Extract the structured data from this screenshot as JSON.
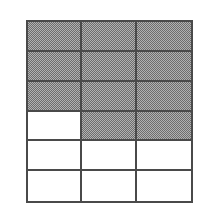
{
  "figure": {
    "type": "area-model-grid",
    "columns": 3,
    "rows": 6,
    "total_cells": 18,
    "shaded_cells": 11,
    "unshaded_cells": 7,
    "fraction_shaded": "11/18",
    "colors": {
      "shaded_fill": "#999999",
      "shaded_dither_dark": "#6e6e6e",
      "shaded_dither_light": "#b2b2b2",
      "unshaded_fill": "#ffffff",
      "grid_line": "#4a4a4a",
      "background": "#ffffff"
    },
    "grid": [
      {
        "row": 1,
        "cells": [
          {
            "col": 1,
            "shaded": true
          },
          {
            "col": 2,
            "shaded": true
          },
          {
            "col": 3,
            "shaded": true
          }
        ]
      },
      {
        "row": 2,
        "cells": [
          {
            "col": 1,
            "shaded": true
          },
          {
            "col": 2,
            "shaded": true
          },
          {
            "col": 3,
            "shaded": true
          }
        ]
      },
      {
        "row": 3,
        "cells": [
          {
            "col": 1,
            "shaded": true
          },
          {
            "col": 2,
            "shaded": true
          },
          {
            "col": 3,
            "shaded": true
          }
        ]
      },
      {
        "row": 4,
        "cells": [
          {
            "col": 1,
            "shaded": false
          },
          {
            "col": 2,
            "shaded": true
          },
          {
            "col": 3,
            "shaded": true
          }
        ]
      },
      {
        "row": 5,
        "cells": [
          {
            "col": 1,
            "shaded": false
          },
          {
            "col": 2,
            "shaded": false
          },
          {
            "col": 3,
            "shaded": false
          }
        ]
      },
      {
        "row": 6,
        "cells": [
          {
            "col": 1,
            "shaded": false
          },
          {
            "col": 2,
            "shaded": false
          },
          {
            "col": 3,
            "shaded": false
          }
        ]
      }
    ]
  }
}
